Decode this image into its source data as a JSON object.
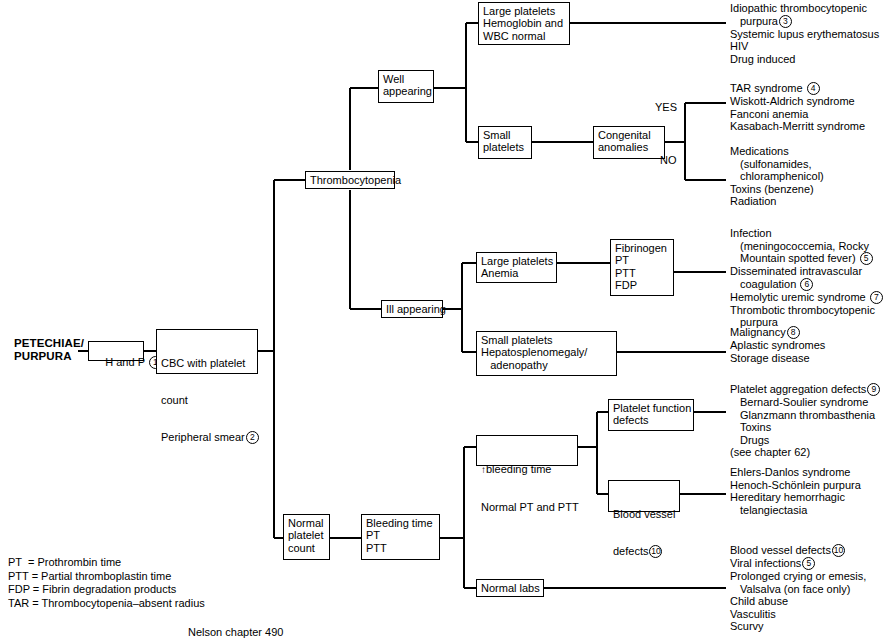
{
  "root": {
    "label": "PETECHIAE/\nPURPURA"
  },
  "nodes": {
    "h_and_p": {
      "text": "H and P ",
      "num": "1"
    },
    "cbc": {
      "line1": "CBC with platelet",
      "line2": "count",
      "line3": "Peripheral smear",
      "num": "2"
    },
    "thrombocytopenia": {
      "text": "Thrombocytopenia"
    },
    "well_appearing": {
      "text": "Well\nappearing"
    },
    "ill_appearing": {
      "text": "Ill appearing"
    },
    "normal_platelet_count": {
      "text": "Normal\nplatelet\ncount"
    },
    "large_platelets_hgb": {
      "text": "Large platelets\nHemoglobin and\nWBC normal"
    },
    "small_platelets": {
      "text": "Small\nplatelets"
    },
    "congenital_anomalies": {
      "text": "Congenital\nanomalies"
    },
    "large_platelets_anemia": {
      "text": "Large platelets\nAnemia"
    },
    "fibrinogen_panel": {
      "text": "Fibrinogen\nPT\nPTT\nFDP"
    },
    "small_platelets_hsm": {
      "text": "Small platelets\nHepatosplenomegaly/\n   adenopathy"
    },
    "bleeding_time_pt_ptt": {
      "text": "Bleeding time\nPT\nPTT"
    },
    "increased_bleeding_time": {
      "arrow": "↑",
      "line1": "bleeding time",
      "line2": "Normal PT and PTT"
    },
    "platelet_function_defects": {
      "text": "Platelet function\ndefects"
    },
    "blood_vessel_defects": {
      "line1": "Blood vessel",
      "line2": "defects",
      "num": "10"
    },
    "normal_labs": {
      "text": "Normal labs"
    }
  },
  "branch_labels": {
    "yes": "YES",
    "no": "NO"
  },
  "outcomes": {
    "itp_group": {
      "lines": [
        {
          "text": "Idiopathic thrombocytopenic",
          "indent": 0
        },
        {
          "text": "purpura",
          "indent": 1,
          "num": "3"
        },
        {
          "text": "Systemic lupus erythematosus",
          "indent": 0
        },
        {
          "text": "HIV",
          "indent": 0
        },
        {
          "text": "Drug induced",
          "indent": 0
        }
      ]
    },
    "congenital_yes_group": {
      "lines": [
        {
          "text": "TAR syndrome ",
          "indent": 0,
          "num": "4"
        },
        {
          "text": "Wiskott-Aldrich syndrome",
          "indent": 0
        },
        {
          "text": "Fanconi anemia",
          "indent": 0
        },
        {
          "text": "Kasabach-Merritt syndrome",
          "indent": 0
        }
      ]
    },
    "congenital_no_group": {
      "lines": [
        {
          "text": "Medications",
          "indent": 0
        },
        {
          "text": "(sulfonamides,",
          "indent": 1
        },
        {
          "text": "chloramphenicol)",
          "indent": 1
        },
        {
          "text": "Toxins (benzene)",
          "indent": 0
        },
        {
          "text": "Radiation",
          "indent": 0
        }
      ]
    },
    "dic_group": {
      "lines": [
        {
          "text": "Infection",
          "indent": 0
        },
        {
          "text": "(meningococcemia, Rocky",
          "indent": 1
        },
        {
          "text": "Mountain spotted fever) ",
          "indent": 1,
          "num": "5"
        },
        {
          "text": "Disseminated intravascular",
          "indent": 0
        },
        {
          "text": "coagulation ",
          "indent": 1,
          "num": "6"
        },
        {
          "text": "Hemolytic uremic syndrome ",
          "indent": 0,
          "num": "7"
        },
        {
          "text": "Thrombotic thrombocytopenic",
          "indent": 0
        },
        {
          "text": "purpura",
          "indent": 1
        }
      ]
    },
    "malignancy_group": {
      "lines": [
        {
          "text": "Malignancy",
          "indent": 0,
          "num": "8"
        },
        {
          "text": "Aplastic syndromes",
          "indent": 0
        },
        {
          "text": "Storage disease",
          "indent": 0
        }
      ]
    },
    "platelet_aggregation_group": {
      "lines": [
        {
          "text": "Platelet aggregation defects",
          "indent": 0,
          "num": "9"
        },
        {
          "text": "Bernard-Soulier syndrome",
          "indent": 1
        },
        {
          "text": "Glanzmann thrombasthenia",
          "indent": 1
        },
        {
          "text": "Toxins",
          "indent": 1
        },
        {
          "text": "Drugs",
          "indent": 1
        },
        {
          "text": "(see chapter 62)",
          "indent": 0
        }
      ]
    },
    "vessel_defects_group": {
      "lines": [
        {
          "text": "Ehlers-Danlos syndrome",
          "indent": 0
        },
        {
          "text": "Henoch-Schönlein purpura",
          "indent": 0
        },
        {
          "text": "Hereditary hemorrhagic",
          "indent": 0
        },
        {
          "text": "telangiectasia",
          "indent": 1
        }
      ]
    },
    "normal_labs_group": {
      "lines": [
        {
          "text": "Blood vessel defects",
          "indent": 0,
          "num": "10"
        },
        {
          "text": "Viral infections",
          "indent": 0,
          "num": "5"
        },
        {
          "text": "Prolonged crying or emesis,",
          "indent": 0
        },
        {
          "text": "Valsalva (on face only)",
          "indent": 1
        },
        {
          "text": "Child abuse",
          "indent": 0
        },
        {
          "text": "Vasculitis",
          "indent": 0
        },
        {
          "text": "Scurvy",
          "indent": 0
        }
      ]
    }
  },
  "legend": {
    "lines": [
      "PT  = Prothrombin time",
      "PTT = Partial thromboplastin time",
      "FDP = Fibrin degradation products",
      "TAR = Thrombocytopenia–absent radius"
    ]
  },
  "source": "Nelson chapter 490",
  "colors": {
    "line": "#000000",
    "text": "#000000",
    "background": "#ffffff"
  }
}
